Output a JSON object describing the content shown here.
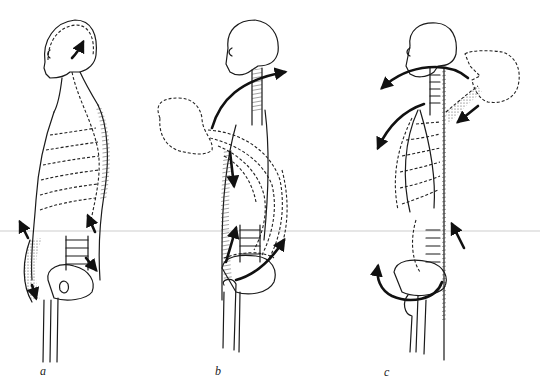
{
  "diagram": {
    "figures": [
      {
        "id": "a",
        "label": "a",
        "view": "upright posture, head and trunk erect, arrows along abdomen and back"
      },
      {
        "id": "b",
        "label": "b",
        "view": "forward flexion, dashed outline of head and trunk bent forward, arrow curving from head over neck"
      },
      {
        "id": "c",
        "label": "c",
        "view": "backward extension, dashed outline of head tilted back, arrows curving forward around neck, chest and pelvis"
      }
    ]
  },
  "colors": {
    "ink": "#1a1a1a",
    "paper": "#ffffff",
    "scan_line": "#e6e6e6"
  }
}
